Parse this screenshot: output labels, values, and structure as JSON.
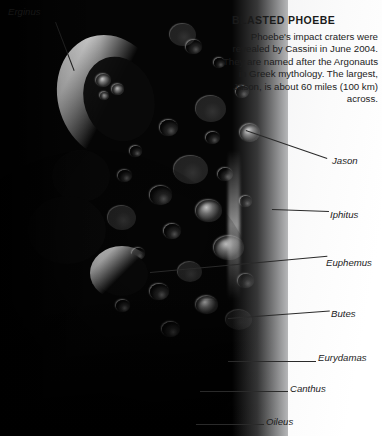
{
  "headline": {
    "title": "BLASTED PHOEBE",
    "caption": "Phoebe's impact craters were revealed by Cassini in June 2004. They are named after the Argonauts in Greek mythology. The largest, Jason, is about 60 miles (100 km) across."
  },
  "subject": {
    "name": "Phoebe",
    "description": "Cratered grayscale moon disc lit from upper right"
  },
  "callouts": [
    {
      "label": "Erginus",
      "position": "top-left"
    },
    {
      "label": "Jason",
      "position": "right"
    },
    {
      "label": "Iphitus",
      "position": "right"
    },
    {
      "label": "Euphemus",
      "position": "right"
    },
    {
      "label": "Butes",
      "position": "right"
    },
    {
      "label": "Eurydamas",
      "position": "right"
    },
    {
      "label": "Canthus",
      "position": "right"
    },
    {
      "label": "Oileus",
      "position": "right"
    }
  ],
  "colors": {
    "text": "#1b1b1b",
    "leader": "#2a2a2a",
    "space": "#050505",
    "page": "#ffffff"
  }
}
